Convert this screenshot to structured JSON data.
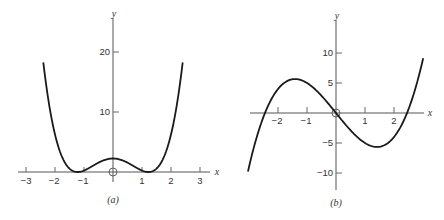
{
  "chart_data": [
    {
      "type": "line",
      "panel_label": "(a)",
      "xlabel": "x",
      "ylabel": "y",
      "function": "y = (x^2 - 1.5)^2",
      "x_ticks": [
        -3,
        -2,
        -1,
        1,
        2,
        3
      ],
      "y_ticks": [
        10,
        20
      ],
      "xlim": [
        -3.3,
        3.6
      ],
      "ylim": [
        -1,
        26
      ],
      "origin_marker": "circle",
      "series": [
        {
          "name": "curve",
          "x": [
            -2.4,
            -2.0,
            -1.5,
            -1.22,
            -1.0,
            -0.5,
            0,
            0.5,
            1.0,
            1.22,
            1.5,
            2.0,
            2.4
          ],
          "y": [
            18.1,
            6.25,
            0.56,
            0.0,
            0.25,
            1.56,
            2.25,
            1.56,
            0.25,
            0.0,
            0.56,
            6.25,
            18.1
          ]
        }
      ],
      "grid": false
    },
    {
      "type": "line",
      "panel_label": "(b)",
      "xlabel": "x",
      "ylabel": "y",
      "function": "y = x^3 - 6x",
      "x_ticks": [
        -2,
        -1,
        1,
        2
      ],
      "y_ticks": [
        -10,
        -5,
        5,
        10
      ],
      "xlim": [
        -3.1,
        3.2
      ],
      "ylim": [
        -13,
        15
      ],
      "origin_marker": "circle",
      "series": [
        {
          "name": "curve",
          "x": [
            -3.03,
            -2.45,
            -2.0,
            -1.41,
            -1.0,
            0,
            1.0,
            1.41,
            2.0,
            2.45,
            3.0
          ],
          "y": [
            -9.6,
            0.0,
            4.0,
            5.66,
            5.0,
            0.0,
            -5.0,
            -5.66,
            -4.0,
            0.0,
            9.0
          ]
        }
      ],
      "grid": false
    }
  ],
  "panels": {
    "a": {
      "caption": "(a)",
      "x_axis_label": "x",
      "y_axis_label": "y",
      "x_tick_labels": [
        "−3",
        "−2",
        "−1",
        "1",
        "2",
        "3"
      ],
      "y_tick_labels": [
        "10",
        "20"
      ]
    },
    "b": {
      "caption": "(b)",
      "x_axis_label": "x",
      "y_axis_label": "y",
      "x_tick_labels": [
        "−2",
        "−1",
        "1",
        "2"
      ],
      "y_tick_labels": [
        "10",
        "5",
        "−5",
        "−10"
      ]
    }
  }
}
